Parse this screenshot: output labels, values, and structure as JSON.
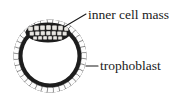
{
  "figure": {
    "kind": "biology-diagram",
    "background_color": "#ffffff",
    "ink_color": "#1a1a1a",
    "cell_fill_color": "#ffffff",
    "labels": [
      {
        "id": "inner-cell-mass",
        "text": "inner cell mass",
        "leader": "diagonal-line-to-upper-left-cell-cluster"
      },
      {
        "id": "trophoblast",
        "text": "trophoblast",
        "leader": "horizontal-dash-to-ring"
      }
    ],
    "structures": {
      "trophoblast_ring": {
        "name": "trophoblast",
        "cell_count": 36,
        "center_x": 50,
        "center_y": 56,
        "outer_radius": 36,
        "inner_radius": 28
      },
      "inner_cell_mass": {
        "name": "inner cell mass",
        "center_x": 48,
        "center_y": 32,
        "width": 44,
        "height": 19,
        "cell_count": 22
      },
      "blastocoel": {
        "name": "blastocoel cavity",
        "fill": "#ffffff"
      }
    }
  }
}
